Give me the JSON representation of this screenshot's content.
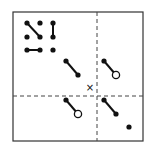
{
  "diagram": {
    "width": 147,
    "height": 147,
    "colors": {
      "ink": "#111111",
      "background": "#ffffff",
      "frame": "#333333"
    },
    "frame": {
      "x": 13,
      "y": 12,
      "w": 130,
      "h": 129
    },
    "crosshair": {
      "vx": 97,
      "hy": 96
    },
    "center_marker": {
      "label": "×",
      "x": 90,
      "y": 88
    },
    "grid_dots": [
      {
        "x": 27,
        "y": 23
      },
      {
        "x": 40,
        "y": 23
      },
      {
        "x": 53,
        "y": 23
      },
      {
        "x": 27,
        "y": 37
      },
      {
        "x": 40,
        "y": 37
      },
      {
        "x": 53,
        "y": 37
      },
      {
        "x": 27,
        "y": 50
      },
      {
        "x": 40,
        "y": 50
      },
      {
        "x": 53,
        "y": 50
      }
    ],
    "grid_links": [
      {
        "x1": 27,
        "y1": 23,
        "x2": 40,
        "y2": 37
      },
      {
        "x1": 53,
        "y1": 23,
        "x2": 53,
        "y2": 37
      },
      {
        "x1": 27,
        "y1": 50,
        "x2": 40,
        "y2": 50
      }
    ],
    "segments": [
      {
        "name": "upper-left-segment",
        "x1": 66,
        "y1": 61,
        "x2": 78,
        "y2": 75,
        "end": "filled"
      },
      {
        "name": "upper-right-segment",
        "x1": 104,
        "y1": 61,
        "x2": 116,
        "y2": 75,
        "end": "open"
      },
      {
        "name": "lower-left-segment",
        "x1": 66,
        "y1": 100,
        "x2": 78,
        "y2": 114,
        "end": "open"
      },
      {
        "name": "lower-right-segment",
        "x1": 104,
        "y1": 100,
        "x2": 116,
        "y2": 114,
        "end": "filled"
      }
    ],
    "lone_dot": {
      "x": 129,
      "y": 127
    }
  }
}
